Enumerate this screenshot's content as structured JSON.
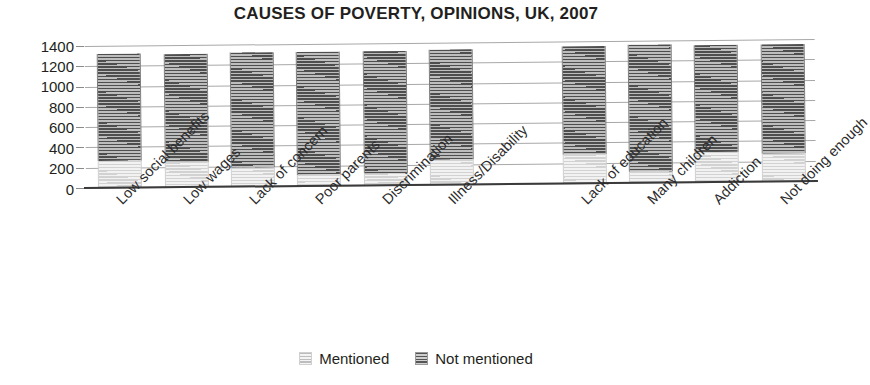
{
  "chart_data": {
    "type": "bar",
    "subtype": "stacked-column",
    "title": "CAUSES OF POVERTY, OPINIONS, UK, 2007",
    "xlabel": "",
    "ylabel": "",
    "ylim": [
      0,
      1400
    ],
    "ytick_step": 200,
    "yticks": [
      0,
      200,
      400,
      600,
      800,
      1000,
      1200,
      1400
    ],
    "ytick_labels": [
      "0",
      "200",
      "400",
      "600",
      "800",
      "1000",
      "1200",
      "1400"
    ],
    "grid": true,
    "grid_axis": "y",
    "legend_position": "bottom",
    "categories": [
      "Low social benefits",
      "Low wages",
      "Lack of concern",
      "Poor parents",
      "Discrimination",
      "Illness/Disability",
      "",
      "Lack of education",
      "Many children",
      "Addiction",
      "Not doing enough"
    ],
    "series": [
      {
        "name": "Mentioned",
        "color": "#e2e2e2",
        "values": [
          270,
          250,
          190,
          110,
          115,
          250,
          0,
          290,
          110,
          300,
          280
        ]
      },
      {
        "name": "Not mentioned",
        "color": "#5a5a5a",
        "values": [
          1050,
          1065,
          1130,
          1215,
          1210,
          1080,
          0,
          1060,
          1250,
          1050,
          1075
        ]
      }
    ],
    "totals": [
      1320,
      1315,
      1320,
      1325,
      1325,
      1330,
      0,
      1350,
      1360,
      1350,
      1355
    ]
  },
  "legend": {
    "items": [
      {
        "label": "Mentioned",
        "swatch": "hatched-light-swatch"
      },
      {
        "label": "Not mentioned",
        "swatch": "hatched-dark-swatch"
      }
    ]
  }
}
